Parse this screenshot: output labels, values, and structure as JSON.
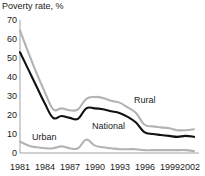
{
  "chart_data": {
    "type": "line",
    "title": "Poverty rate, %",
    "xlabel": "",
    "ylabel": "Poverty rate, %",
    "ylim": [
      0,
      70
    ],
    "xlim": [
      1981,
      2002
    ],
    "grid": false,
    "legend_position": "inline-annotations",
    "yticks": [
      0,
      10,
      20,
      30,
      40,
      50,
      60,
      70
    ],
    "ytick_labels": [
      "0",
      "10",
      "20",
      "30",
      "40",
      "50",
      "60",
      "70"
    ],
    "xticks": [
      1981,
      1984,
      1987,
      1990,
      1993,
      1996,
      1999,
      2002
    ],
    "xtick_labels": [
      "1981",
      "1984",
      "1987",
      "1990",
      "1993",
      "1996",
      "1999",
      "2002"
    ],
    "x": [
      1981,
      1982,
      1983,
      1984,
      1985,
      1986,
      1987,
      1988,
      1989,
      1990,
      1991,
      1992,
      1993,
      1994,
      1995,
      1996,
      1997,
      1998,
      1999,
      2000,
      2001,
      2002
    ],
    "series": [
      {
        "name": "Rural",
        "color": "#b3b3b3",
        "label": "Rural",
        "values": [
          64.5,
          53.0,
          42.0,
          32.0,
          23.0,
          23.5,
          22.5,
          23.0,
          28.5,
          29.5,
          29.0,
          27.5,
          26.5,
          24.0,
          21.0,
          15.0,
          14.0,
          13.5,
          13.0,
          12.0,
          12.0,
          12.5
        ]
      },
      {
        "name": "National",
        "color": "#111111",
        "label": "National",
        "values": [
          53.0,
          44.0,
          35.0,
          26.0,
          18.5,
          19.5,
          18.5,
          18.0,
          23.5,
          23.5,
          23.0,
          22.0,
          21.0,
          19.0,
          16.0,
          11.0,
          10.0,
          9.5,
          9.0,
          8.5,
          9.0,
          8.5
        ]
      },
      {
        "name": "Urban",
        "color": "#b3b3b3",
        "label": "Urban",
        "values": [
          6.0,
          4.0,
          3.0,
          2.5,
          2.5,
          3.5,
          2.5,
          2.5,
          7.0,
          4.0,
          3.0,
          2.5,
          2.0,
          2.0,
          2.0,
          1.5,
          1.5,
          1.5,
          1.5,
          1.5,
          1.5,
          1.0
        ]
      }
    ],
    "annotations": [
      {
        "text": "Rural",
        "x": 1996,
        "y": 26
      },
      {
        "text": "National",
        "x": 1991,
        "y": 15
      },
      {
        "text": "Urban",
        "x": 1983.5,
        "y": 10
      }
    ]
  }
}
